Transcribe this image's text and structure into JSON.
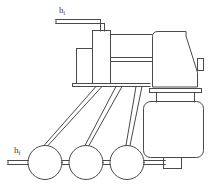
{
  "diagram": {
    "background_color": "#ffffff",
    "line_color": "#4a4a4a",
    "label_color": "#3a3a3a",
    "labels": [
      {
        "id": "inlet-head",
        "symbol": "h",
        "subscript": "i",
        "x": 59,
        "y": 6,
        "description": "inlet head level marker on upper supply pipe"
      },
      {
        "id": "final-head",
        "symbol": "h",
        "subscript": "f",
        "x": 14,
        "y": 146,
        "description": "final head level marker on lower roller line"
      }
    ],
    "parts": [
      {
        "name": "upper-supply-pipe",
        "type": "double-line-pipe",
        "orientation": "horizontal"
      },
      {
        "name": "pipe-elbow-riser",
        "type": "double-line-pipe",
        "orientation": "vertical"
      },
      {
        "name": "tall-column-box",
        "type": "rectangle"
      },
      {
        "name": "short-side-box",
        "type": "rectangle"
      },
      {
        "name": "upper-rail",
        "type": "line",
        "orientation": "horizontal"
      },
      {
        "name": "middle-rail-pair",
        "type": "double-line",
        "orientation": "horizontal"
      },
      {
        "name": "base-plate",
        "type": "bar",
        "orientation": "horizontal"
      },
      {
        "name": "main-housing",
        "type": "polygon-angled-top"
      },
      {
        "name": "housing-side-tab",
        "type": "rectangle"
      },
      {
        "name": "flange-plate",
        "type": "bar",
        "orientation": "horizontal"
      },
      {
        "name": "pedestal-legs",
        "type": "line-pair",
        "orientation": "vertical"
      },
      {
        "name": "lower-drum-body",
        "type": "rounded-rectangle"
      },
      {
        "name": "drum-foot-nub",
        "type": "rectangle"
      },
      {
        "name": "roller-1",
        "type": "circle"
      },
      {
        "name": "roller-2",
        "type": "circle"
      },
      {
        "name": "roller-3",
        "type": "circle"
      },
      {
        "name": "roller-shaft-line",
        "type": "double-line",
        "orientation": "horizontal"
      },
      {
        "name": "support-strut-group",
        "type": "diagonal-line-pairs",
        "count": 3
      }
    ]
  }
}
